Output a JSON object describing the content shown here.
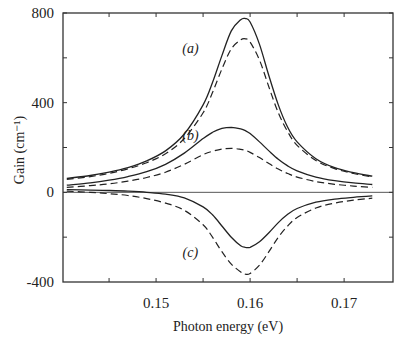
{
  "chart_data": {
    "type": "line",
    "title": "",
    "xlabel": "Photon energy (eV)",
    "ylabel": "Gain (cm⁻¹)",
    "xlim": [
      0.1401,
      0.1752
    ],
    "ylim": [
      -400,
      800
    ],
    "xticks": [
      0.145,
      0.15,
      0.155,
      0.16,
      0.165,
      0.17
    ],
    "xtick_labels": [
      {
        "value": 0.15,
        "label": "0.15"
      },
      {
        "value": 0.16,
        "label": "0.16"
      },
      {
        "value": 0.17,
        "label": "0.17"
      }
    ],
    "yticks": [
      -200,
      0,
      200,
      400,
      600,
      800
    ],
    "ytick_labels": [
      {
        "value": 800,
        "label": "800"
      },
      {
        "value": 400,
        "label": "400"
      },
      {
        "value": 0,
        "label": "0"
      },
      {
        "value": -400,
        "label": "-400"
      }
    ],
    "grid": false,
    "zero_line": true,
    "x": [
      0.1405,
      0.143,
      0.145,
      0.147,
      0.149,
      0.151,
      0.153,
      0.155,
      0.156,
      0.157,
      0.158,
      0.159,
      0.1595,
      0.16,
      0.161,
      0.162,
      0.163,
      0.164,
      0.165,
      0.167,
      0.169,
      0.171,
      0.173
    ],
    "series": [
      {
        "name": "(a) solid",
        "style": "solid",
        "values": [
          62,
          75,
          90,
          110,
          140,
          185,
          260,
          390,
          490,
          610,
          720,
          770,
          775,
          760,
          660,
          520,
          390,
          290,
          225,
          150,
          110,
          88,
          72
        ]
      },
      {
        "name": "(a) dashed",
        "style": "dashed",
        "values": [
          58,
          70,
          85,
          105,
          132,
          172,
          240,
          355,
          445,
          550,
          640,
          680,
          685,
          670,
          590,
          470,
          355,
          270,
          210,
          142,
          106,
          84,
          68
        ]
      },
      {
        "name": "(b) solid",
        "style": "solid",
        "values": [
          32,
          42,
          54,
          70,
          92,
          125,
          175,
          240,
          268,
          285,
          290,
          283,
          275,
          262,
          225,
          185,
          148,
          118,
          96,
          68,
          52,
          42,
          35
        ]
      },
      {
        "name": "(b) dashed",
        "style": "dashed",
        "values": [
          22,
          30,
          38,
          50,
          66,
          90,
          125,
          168,
          183,
          193,
          196,
          192,
          187,
          178,
          155,
          128,
          104,
          84,
          68,
          48,
          36,
          28,
          22
        ]
      },
      {
        "name": "(c) solid",
        "style": "solid",
        "values": [
          12,
          10,
          8,
          5,
          0,
          -8,
          -25,
          -65,
          -100,
          -150,
          -200,
          -238,
          -245,
          -245,
          -220,
          -180,
          -135,
          -98,
          -72,
          -44,
          -30,
          -22,
          -16
        ]
      },
      {
        "name": "(c) dashed",
        "style": "dashed",
        "values": [
          5,
          0,
          -6,
          -14,
          -28,
          -48,
          -80,
          -145,
          -200,
          -265,
          -320,
          -355,
          -365,
          -362,
          -325,
          -265,
          -200,
          -150,
          -112,
          -70,
          -48,
          -35,
          -26
        ]
      }
    ],
    "annotations": [
      {
        "text": "(a)",
        "x": 0.1545,
        "y": 645
      },
      {
        "text": "(b)",
        "x": 0.1545,
        "y": 255
      },
      {
        "text": "(c)",
        "x": 0.1545,
        "y": -265
      }
    ]
  }
}
